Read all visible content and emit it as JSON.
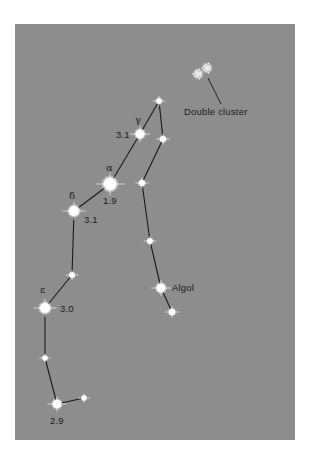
{
  "diagram": {
    "background_color": "#8d8d8d",
    "line_color": "#1a1a1a",
    "star_color": "#ffffff",
    "stars": [
      {
        "id": "s1",
        "x": 159,
        "y": 101,
        "r": 2.6
      },
      {
        "id": "gamma",
        "x": 140,
        "y": 134,
        "r": 4.2,
        "greek": "γ",
        "magnitude": "3.1"
      },
      {
        "id": "s3",
        "x": 163,
        "y": 139,
        "r": 2.8
      },
      {
        "id": "alpha",
        "x": 110,
        "y": 184,
        "r": 6.0,
        "greek": "α",
        "magnitude": "1.9"
      },
      {
        "id": "s5",
        "x": 142,
        "y": 183,
        "r": 2.8
      },
      {
        "id": "delta",
        "x": 74,
        "y": 211,
        "r": 4.8,
        "greek": "δ",
        "magnitude": "3.1"
      },
      {
        "id": "s7",
        "x": 150,
        "y": 241,
        "r": 2.6
      },
      {
        "id": "s8",
        "x": 72,
        "y": 275,
        "r": 2.6
      },
      {
        "id": "algol",
        "x": 161,
        "y": 288,
        "r": 4.2,
        "name": "Algol"
      },
      {
        "id": "epsilon",
        "x": 45,
        "y": 308,
        "r": 4.8,
        "greek": "ε",
        "magnitude": "3.0"
      },
      {
        "id": "s11",
        "x": 172,
        "y": 312,
        "r": 3.0
      },
      {
        "id": "s12",
        "x": 45,
        "y": 358,
        "r": 2.4
      },
      {
        "id": "s13",
        "x": 57,
        "y": 404,
        "r": 4.0,
        "magnitude": "2.9"
      },
      {
        "id": "s14",
        "x": 84,
        "y": 398,
        "r": 2.4
      }
    ],
    "lines": [
      [
        "s1",
        "gamma"
      ],
      [
        "s1",
        "s3"
      ],
      [
        "gamma",
        "alpha"
      ],
      [
        "s3",
        "s5"
      ],
      [
        "alpha",
        "delta"
      ],
      [
        "s5",
        "s7"
      ],
      [
        "delta",
        "s8"
      ],
      [
        "s7",
        "algol"
      ],
      [
        "algol",
        "s11"
      ],
      [
        "s8",
        "epsilon"
      ],
      [
        "epsilon",
        "s12"
      ],
      [
        "s12",
        "s13"
      ],
      [
        "s13",
        "s14"
      ]
    ],
    "labels": {
      "gamma_greek": "γ",
      "gamma_mag": "3.1",
      "alpha_greek": "α",
      "alpha_mag": "1.9",
      "delta_greek": "δ",
      "delta_mag": "3.1",
      "epsilon_greek": "ε",
      "epsilon_mag": "3.0",
      "bottom_mag": "2.9",
      "algol": "Algol",
      "double_cluster": "Double cluster"
    },
    "double_cluster": {
      "blobs": [
        {
          "x": 198,
          "y": 74
        },
        {
          "x": 207,
          "y": 68
        }
      ],
      "pointer": {
        "x1": 208,
        "y1": 78,
        "x2": 221,
        "y2": 104
      }
    }
  }
}
